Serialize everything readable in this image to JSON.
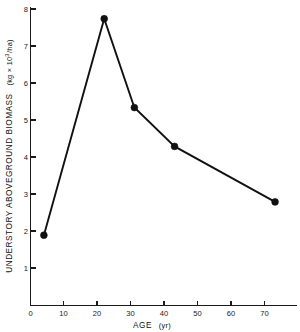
{
  "chart_data": {
    "type": "line",
    "title": "",
    "subtitle": "",
    "xlabel": "AGE (yr)",
    "ylabel": "UNDERSTORY ABOVEGROUND BIOMASS (kg × 10³/ha)",
    "ylabel_main": "UNDERSTORY ABOVEGROUND BIOMASS",
    "ylabel_units_prefix": "(kg × 10",
    "ylabel_units_exponent": "3",
    "ylabel_units_suffix": "/ha)",
    "xlabel_main": "AGE",
    "xlabel_units": "(yr)",
    "x": [
      4,
      22,
      31,
      43,
      73
    ],
    "values": [
      1.9,
      7.75,
      5.35,
      4.3,
      2.8
    ],
    "points": [
      {
        "x": 4,
        "y": 1.9
      },
      {
        "x": 22,
        "y": 7.75
      },
      {
        "x": 31,
        "y": 5.35
      },
      {
        "x": 43,
        "y": 4.3
      },
      {
        "x": 73,
        "y": 2.8
      }
    ],
    "xlim": [
      0,
      76
    ],
    "ylim": [
      0,
      8
    ],
    "xticks": [
      0,
      10,
      20,
      30,
      40,
      50,
      60,
      70
    ],
    "xticklabels": [
      "0",
      "10",
      "20",
      "30",
      "40",
      "50",
      "60",
      "70"
    ],
    "yticks": [
      1,
      2,
      3,
      4,
      5,
      6,
      7,
      8
    ],
    "yticklabels": [
      "1",
      "2",
      "3",
      "4",
      "5",
      "6",
      "7",
      "8"
    ],
    "grid": false,
    "legend": false,
    "legend_position": "none",
    "marker": "filled-circle",
    "line_color": "#111111",
    "marker_color": "#111111",
    "background_color": "#ffffff",
    "axis_color": "#1a1a1a"
  }
}
